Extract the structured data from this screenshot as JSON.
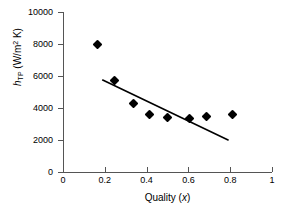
{
  "chart_data": {
    "type": "scatter",
    "title": "",
    "xlabel": "Quality (x)",
    "ylabel": "h_TP (W/m2 K)",
    "xlim": [
      0,
      1
    ],
    "ylim": [
      0,
      10000
    ],
    "grid": false,
    "legend": "none",
    "xticks": [
      "0",
      "0.2",
      "0.4",
      "0.6",
      "0.8",
      "1"
    ],
    "xtick_values": [
      0,
      0.2,
      0.4,
      0.6,
      0.8,
      1
    ],
    "yticks": [
      "0",
      "2000",
      "4000",
      "6000",
      "8000",
      "10000"
    ],
    "ytick_values": [
      0,
      2000,
      4000,
      6000,
      8000,
      10000
    ],
    "series": [
      {
        "name": "data",
        "marker": "diamond",
        "color": "#000000",
        "x": [
          0.167,
          0.245,
          0.335,
          0.412,
          0.5,
          0.605,
          0.685,
          0.81
        ],
        "y": [
          8000,
          5700,
          4300,
          3600,
          3400,
          3350,
          3450,
          3575
        ]
      },
      {
        "name": "trend-line",
        "type": "line",
        "color": "#000000",
        "x": [
          0.19,
          0.79
        ],
        "y": [
          5750,
          2000
        ]
      }
    ]
  },
  "axis": {
    "x_title_main": "Quality (",
    "x_title_var": "x",
    "x_title_close": ")",
    "y_title_var": "h",
    "y_title_sub": "TP",
    "y_title_units_open": " (W/m",
    "y_title_units_sup": "2",
    "y_title_units_close": " K)"
  }
}
